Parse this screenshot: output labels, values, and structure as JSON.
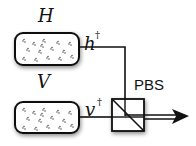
{
  "diagram": {
    "sources": [
      {
        "label": "H",
        "mode_label": "h",
        "mode_sup": "†"
      },
      {
        "label": "V",
        "mode_label": "v",
        "mode_sup": "†"
      }
    ],
    "beam_splitter": {
      "label": "PBS"
    },
    "colors": {
      "stroke": "#111111",
      "box_fill": "#ffffff",
      "dots": "#333333"
    }
  }
}
